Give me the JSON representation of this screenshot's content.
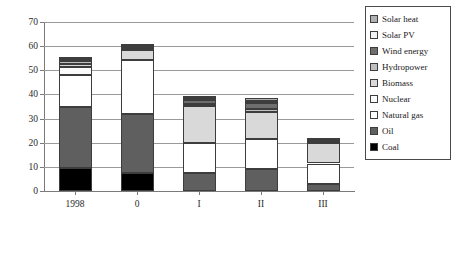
{
  "chart_data": {
    "type": "bar",
    "subtype": "stacked-vertical",
    "title": "",
    "xlabel": "",
    "ylabel": "",
    "ylim": [
      0,
      70
    ],
    "ytick_values": [
      0,
      10,
      20,
      30,
      40,
      50,
      60,
      70
    ],
    "ytick_labels": [
      "0",
      "10",
      "20",
      "30",
      "40",
      "50",
      "60",
      "70"
    ],
    "grid": true,
    "grid_axis": "y",
    "legend_position": "right-top",
    "categories": [
      "1998",
      "0",
      "I",
      "II",
      "III"
    ],
    "series": [
      {
        "name": "Coal",
        "color": "#000000",
        "values": [
          9.5,
          7.5,
          0.0,
          0.0,
          0.0
        ]
      },
      {
        "name": "Oil",
        "color": "#5f5f5f",
        "values": [
          25.5,
          24.5,
          7.3,
          9.3,
          2.8
        ]
      },
      {
        "name": "Natural gas",
        "color": "#ffffff",
        "values": [
          13.2,
          22.3,
          12.4,
          12.1,
          8.6
        ]
      },
      {
        "name": "Nuclear",
        "color": "#fbfbfb",
        "values": [
          3.0,
          0.0,
          0.0,
          0.0,
          0.0
        ]
      },
      {
        "name": "Biomass",
        "color": "#d9d9d9",
        "values": [
          1.6,
          4.3,
          15.7,
          11.4,
          8.3
        ]
      },
      {
        "name": "Hydropower",
        "color": "#bfbfbf",
        "values": [
          1.1,
          0.8,
          0.8,
          1.0,
          0.5
        ]
      },
      {
        "name": "Wind energy",
        "color": "#6e6e6e",
        "values": [
          0.5,
          0.5,
          1.6,
          2.6,
          0.5
        ]
      },
      {
        "name": "Solar PV",
        "color": "#f2f2f2",
        "values": [
          0.3,
          0.3,
          0.8,
          1.0,
          0.4
        ]
      },
      {
        "name": "Solar heat",
        "color": "#b0b0b0",
        "values": [
          0.3,
          0.3,
          0.9,
          1.1,
          0.4
        ]
      }
    ],
    "totals": [
      54.0,
      60.5,
      39.5,
      38.5,
      21.5
    ],
    "legend_entries": [
      {
        "label": "Solar heat",
        "color": "#b0b0b0"
      },
      {
        "label": "Solar PV",
        "color": "#f2f2f2"
      },
      {
        "label": "Wind energy",
        "color": "#6e6e6e"
      },
      {
        "label": "Hydropower",
        "color": "#bfbfbf"
      },
      {
        "label": "Biomass",
        "color": "#d9d9d9"
      },
      {
        "label": "Nuclear",
        "color": "#fbfbfb"
      },
      {
        "label": "Natural gas",
        "color": "#ffffff"
      },
      {
        "label": "Oil",
        "color": "#5f5f5f"
      },
      {
        "label": "Coal",
        "color": "#000000"
      }
    ]
  }
}
